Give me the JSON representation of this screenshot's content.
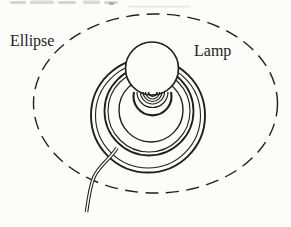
{
  "figure": {
    "type": "line-diagram",
    "labels": {
      "ellipse": "Ellipse",
      "lamp": "Lamp"
    },
    "colors": {
      "ink": "#1f1f1f",
      "paper": "#fcfcfb"
    }
  }
}
